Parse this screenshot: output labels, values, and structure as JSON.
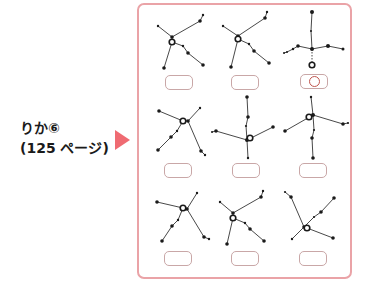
{
  "label": {
    "line1": "りか⑥",
    "line2": "(125 ページ)"
  },
  "colors": {
    "accent": "#ef6b72",
    "panel_border": "#eaa3a7",
    "answer_box_border": "#c9a7a7",
    "answer_mark": "#c0554e",
    "star": "#1a1a1a"
  },
  "icons": {
    "pointer": "right-triangle-icon",
    "answer_mark": "circle-mark-icon"
  },
  "grid": {
    "rows": 3,
    "cols": 3,
    "items": [
      {
        "id": 1,
        "marked": false
      },
      {
        "id": 2,
        "marked": false
      },
      {
        "id": 3,
        "marked": true
      },
      {
        "id": 4,
        "marked": false
      },
      {
        "id": 5,
        "marked": false
      },
      {
        "id": 6,
        "marked": false
      },
      {
        "id": 7,
        "marked": false
      },
      {
        "id": 8,
        "marked": false
      },
      {
        "id": 9,
        "marked": false
      }
    ]
  }
}
